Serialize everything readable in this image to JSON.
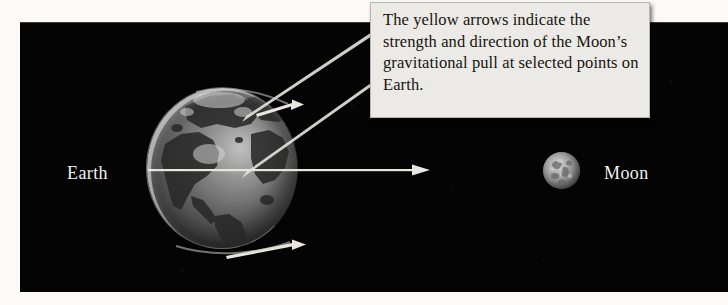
{
  "figure": {
    "background_color": "#fbfaf8",
    "space_color": "#040404"
  },
  "callout": {
    "name": "caption-callout",
    "text": "The yellow arrows indicate the strength and direction of the Moon’s gravitational pull at selected points on Earth.",
    "background_color": "#eceae6",
    "text_color": "#16140f",
    "border_color": "#b9b6b0"
  },
  "bodies": [
    {
      "id": "earth",
      "label": "Earth",
      "label_color": "#f2f2f2",
      "diameter_px": 150,
      "center_x": 222,
      "center_y": 168
    },
    {
      "id": "moon",
      "label": "Moon",
      "label_color": "#f2f2f2",
      "diameter_px": 37,
      "center_x": 561,
      "center_y": 170
    }
  ],
  "arrows": {
    "color": "#e8e6e0",
    "description": "Yellow arrows indicating strength and direction of gravitational pull",
    "items": [
      {
        "id": "arrow-north",
        "position": "near-north-pole",
        "from_x": 258,
        "from_y": 112,
        "to_x": 303,
        "to_y": 100
      },
      {
        "id": "arrow-equator",
        "position": "equator-sub-lunar-point",
        "from_x": 150,
        "from_y": 170,
        "to_x": 428,
        "to_y": 170
      },
      {
        "id": "arrow-south",
        "position": "near-south-pole",
        "from_x": 228,
        "from_y": 254,
        "to_x": 305,
        "to_y": 241
      }
    ]
  },
  "leader_lines": {
    "color": "#e2e0da",
    "count": 2,
    "description": "Two tapered pointers from the caption box to the Earth"
  }
}
